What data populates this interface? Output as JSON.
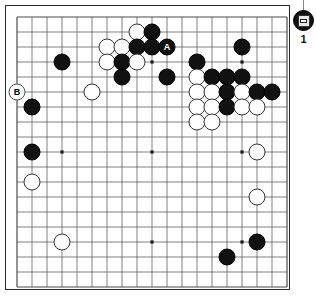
{
  "board": {
    "size": 19,
    "origin": 12,
    "spacing": 15.0,
    "line_color": "#4a4a4a",
    "border_color": "#2b2b2b",
    "background": "#ffffff",
    "star_points": [
      [
        3,
        3
      ],
      [
        9,
        3
      ],
      [
        15,
        3
      ],
      [
        3,
        9
      ],
      [
        9,
        9
      ],
      [
        15,
        9
      ],
      [
        3,
        15
      ],
      [
        9,
        15
      ],
      [
        15,
        15
      ]
    ],
    "stones": [
      {
        "color": "white",
        "col": 8,
        "row": 1,
        "label": ""
      },
      {
        "color": "black",
        "col": 9,
        "row": 1,
        "label": ""
      },
      {
        "color": "white",
        "col": 6,
        "row": 2,
        "label": ""
      },
      {
        "color": "white",
        "col": 7,
        "row": 2,
        "label": ""
      },
      {
        "color": "black",
        "col": 8,
        "row": 2,
        "label": ""
      },
      {
        "color": "black",
        "col": 9,
        "row": 2,
        "label": ""
      },
      {
        "color": "black",
        "col": 10,
        "row": 2,
        "label": "A"
      },
      {
        "color": "black",
        "col": 15,
        "row": 2,
        "label": ""
      },
      {
        "color": "white",
        "col": 6,
        "row": 3,
        "label": ""
      },
      {
        "color": "black",
        "col": 7,
        "row": 3,
        "label": ""
      },
      {
        "color": "white",
        "col": 8,
        "row": 3,
        "label": ""
      },
      {
        "color": "black",
        "col": 3,
        "row": 3,
        "label": ""
      },
      {
        "color": "black",
        "col": 12,
        "row": 3,
        "label": ""
      },
      {
        "color": "black",
        "col": 7,
        "row": 4,
        "label": ""
      },
      {
        "color": "black",
        "col": 10,
        "row": 4,
        "label": ""
      },
      {
        "color": "white",
        "col": 12,
        "row": 4,
        "label": ""
      },
      {
        "color": "black",
        "col": 13,
        "row": 4,
        "label": ""
      },
      {
        "color": "black",
        "col": 14,
        "row": 4,
        "label": ""
      },
      {
        "color": "black",
        "col": 15,
        "row": 4,
        "label": ""
      },
      {
        "color": "white",
        "col": 5,
        "row": 5,
        "label": ""
      },
      {
        "color": "white",
        "col": 12,
        "row": 5,
        "label": ""
      },
      {
        "color": "white",
        "col": 13,
        "row": 5,
        "label": ""
      },
      {
        "color": "black",
        "col": 14,
        "row": 5,
        "label": ""
      },
      {
        "color": "white",
        "col": 15,
        "row": 5,
        "label": ""
      },
      {
        "color": "black",
        "col": 16,
        "row": 5,
        "label": ""
      },
      {
        "color": "black",
        "col": 17,
        "row": 5,
        "label": ""
      },
      {
        "color": "white",
        "col": 12,
        "row": 6,
        "label": ""
      },
      {
        "color": "white",
        "col": 13,
        "row": 6,
        "label": ""
      },
      {
        "color": "black",
        "col": 14,
        "row": 6,
        "label": ""
      },
      {
        "color": "white",
        "col": 15,
        "row": 6,
        "label": ""
      },
      {
        "color": "white",
        "col": 16,
        "row": 6,
        "label": ""
      },
      {
        "color": "black",
        "col": 1,
        "row": 6,
        "label": ""
      },
      {
        "color": "white",
        "col": 12,
        "row": 7,
        "label": ""
      },
      {
        "color": "white",
        "col": 13,
        "row": 7,
        "label": ""
      },
      {
        "color": "black",
        "col": 1,
        "row": 9,
        "label": ""
      },
      {
        "color": "white",
        "col": 16,
        "row": 9,
        "label": ""
      },
      {
        "color": "white",
        "col": 1,
        "row": 11,
        "label": ""
      },
      {
        "color": "white",
        "col": 16,
        "row": 12,
        "label": ""
      },
      {
        "color": "white",
        "col": 3,
        "row": 15,
        "label": ""
      },
      {
        "color": "black",
        "col": 16,
        "row": 15,
        "label": ""
      },
      {
        "color": "black",
        "col": 14,
        "row": 16,
        "label": ""
      }
    ],
    "markers": [
      {
        "label": "B",
        "col": 0,
        "row": 5
      }
    ]
  },
  "side_panel": {
    "tool_icon": "board-tool-icon",
    "move_number": "1"
  }
}
